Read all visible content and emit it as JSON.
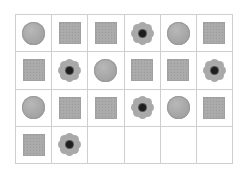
{
  "grid": {
    "rows": 4,
    "cols": 6,
    "colors": {
      "line": "#cfcfcf",
      "shape": "#aaaaaa",
      "center": "#1e1e1e"
    },
    "cells": [
      "circle",
      "square",
      "square",
      "flower",
      "circle",
      "square",
      "square",
      "flower",
      "circle",
      "square",
      "square",
      "flower",
      "circle",
      "square",
      "square",
      "flower",
      "circle",
      "square",
      "square",
      "flower",
      "empty",
      "empty",
      "empty",
      "empty"
    ]
  }
}
